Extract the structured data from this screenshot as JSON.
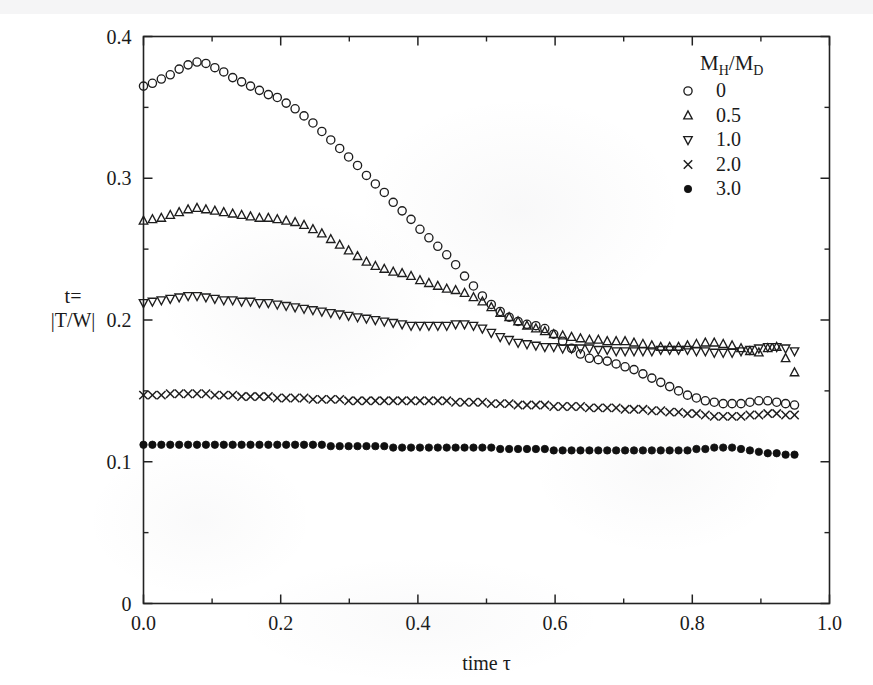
{
  "figure": {
    "background_color": "#ffffff",
    "ink_color": "#1a1a1a"
  },
  "chart_data": {
    "type": "scatter",
    "title": "",
    "xlabel": "time τ",
    "ylabel_line1": "t=",
    "ylabel_line2": "|T/W|",
    "xlim": [
      0.0,
      1.0
    ],
    "ylim": [
      0.0,
      0.4
    ],
    "grid": false,
    "xticks": [
      0.0,
      0.2,
      0.4,
      0.6,
      0.8,
      1.0
    ],
    "xticklabels": [
      "0.0",
      "0.2",
      "0.4",
      "0.6",
      "0.8",
      "1.0"
    ],
    "xticks_minor": [
      0.1,
      0.3,
      0.5,
      0.7,
      0.9
    ],
    "yticks": [
      0.0,
      0.1,
      0.2,
      0.3,
      0.4
    ],
    "yticklabels": [
      "0",
      "0.1",
      "0.2",
      "0.3",
      "0.4"
    ],
    "yticks_minor": [
      0.05,
      0.15,
      0.25,
      0.35
    ],
    "legend": {
      "title": "M_H/M_D",
      "title_parts": {
        "m": "M",
        "sub_h": "H",
        "slash": "/",
        "m2": "M",
        "sub_d": "D"
      },
      "position": "upper right",
      "entries": [
        {
          "label": "0",
          "marker": "circle-open"
        },
        {
          "label": "0.5",
          "marker": "triangle-up-open"
        },
        {
          "label": "1.0",
          "marker": "triangle-down-open"
        },
        {
          "label": "2.0",
          "marker": "cross"
        },
        {
          "label": "3.0",
          "marker": "circle-filled"
        }
      ]
    },
    "series": [
      {
        "name": "0",
        "marker": "circle-open",
        "x": [
          0.0,
          0.013,
          0.026,
          0.039,
          0.052,
          0.065,
          0.078,
          0.091,
          0.104,
          0.117,
          0.13,
          0.143,
          0.156,
          0.169,
          0.182,
          0.195,
          0.208,
          0.221,
          0.234,
          0.247,
          0.26,
          0.273,
          0.286,
          0.299,
          0.312,
          0.325,
          0.338,
          0.351,
          0.364,
          0.377,
          0.39,
          0.403,
          0.416,
          0.429,
          0.442,
          0.455,
          0.468,
          0.481,
          0.494,
          0.507,
          0.52,
          0.533,
          0.546,
          0.559,
          0.572,
          0.585,
          0.598,
          0.611,
          0.624,
          0.637,
          0.65,
          0.663,
          0.676,
          0.689,
          0.702,
          0.715,
          0.728,
          0.741,
          0.754,
          0.767,
          0.78,
          0.793,
          0.806,
          0.819,
          0.832,
          0.845,
          0.858,
          0.871,
          0.884,
          0.897,
          0.91,
          0.923,
          0.936,
          0.949
        ],
        "y": [
          0.365,
          0.367,
          0.37,
          0.373,
          0.377,
          0.38,
          0.382,
          0.381,
          0.378,
          0.375,
          0.371,
          0.368,
          0.365,
          0.362,
          0.359,
          0.357,
          0.353,
          0.349,
          0.344,
          0.339,
          0.333,
          0.327,
          0.321,
          0.315,
          0.309,
          0.302,
          0.296,
          0.29,
          0.283,
          0.277,
          0.271,
          0.264,
          0.258,
          0.252,
          0.246,
          0.239,
          0.231,
          0.224,
          0.217,
          0.211,
          0.206,
          0.202,
          0.199,
          0.197,
          0.196,
          0.194,
          0.19,
          0.185,
          0.18,
          0.176,
          0.173,
          0.172,
          0.171,
          0.169,
          0.167,
          0.165,
          0.162,
          0.159,
          0.156,
          0.153,
          0.15,
          0.147,
          0.145,
          0.143,
          0.142,
          0.141,
          0.141,
          0.141,
          0.142,
          0.143,
          0.143,
          0.142,
          0.141,
          0.14
        ],
        "note": "rises to a maximum near tau=0.06 then decays monotonically, flattening near 0.14"
      },
      {
        "name": "0.5",
        "marker": "triangle-up-open",
        "x": [
          0.0,
          0.013,
          0.026,
          0.039,
          0.052,
          0.065,
          0.078,
          0.091,
          0.104,
          0.117,
          0.13,
          0.143,
          0.156,
          0.169,
          0.182,
          0.195,
          0.208,
          0.221,
          0.234,
          0.247,
          0.26,
          0.273,
          0.286,
          0.299,
          0.312,
          0.325,
          0.338,
          0.351,
          0.364,
          0.377,
          0.39,
          0.403,
          0.416,
          0.429,
          0.442,
          0.455,
          0.468,
          0.481,
          0.494,
          0.507,
          0.52,
          0.533,
          0.546,
          0.559,
          0.572,
          0.585,
          0.598,
          0.611,
          0.624,
          0.637,
          0.65,
          0.663,
          0.676,
          0.689,
          0.702,
          0.715,
          0.728,
          0.741,
          0.754,
          0.767,
          0.78,
          0.793,
          0.806,
          0.819,
          0.832,
          0.845,
          0.858,
          0.871,
          0.884,
          0.897,
          0.91,
          0.923,
          0.936,
          0.949
        ],
        "y": [
          0.27,
          0.271,
          0.272,
          0.274,
          0.276,
          0.278,
          0.279,
          0.278,
          0.277,
          0.276,
          0.275,
          0.274,
          0.273,
          0.272,
          0.272,
          0.271,
          0.27,
          0.269,
          0.267,
          0.264,
          0.261,
          0.257,
          0.253,
          0.249,
          0.245,
          0.241,
          0.238,
          0.236,
          0.234,
          0.233,
          0.231,
          0.228,
          0.226,
          0.224,
          0.222,
          0.221,
          0.219,
          0.216,
          0.213,
          0.209,
          0.205,
          0.202,
          0.199,
          0.196,
          0.194,
          0.192,
          0.19,
          0.189,
          0.188,
          0.187,
          0.186,
          0.186,
          0.185,
          0.185,
          0.185,
          0.184,
          0.183,
          0.182,
          0.181,
          0.181,
          0.181,
          0.182,
          0.183,
          0.184,
          0.184,
          0.183,
          0.182,
          0.18,
          0.178,
          0.177,
          0.18,
          0.181,
          0.173,
          0.163
        ],
        "note": "broad low maximum near tau=0.08, slow decline to about 0.18"
      },
      {
        "name": "1.0",
        "marker": "triangle-down-open",
        "x": [
          0.0,
          0.013,
          0.026,
          0.039,
          0.052,
          0.065,
          0.078,
          0.091,
          0.104,
          0.117,
          0.13,
          0.143,
          0.156,
          0.169,
          0.182,
          0.195,
          0.208,
          0.221,
          0.234,
          0.247,
          0.26,
          0.273,
          0.286,
          0.299,
          0.312,
          0.325,
          0.338,
          0.351,
          0.364,
          0.377,
          0.39,
          0.403,
          0.416,
          0.429,
          0.442,
          0.455,
          0.468,
          0.481,
          0.494,
          0.507,
          0.52,
          0.533,
          0.546,
          0.559,
          0.572,
          0.585,
          0.598,
          0.611,
          0.624,
          0.637,
          0.65,
          0.663,
          0.676,
          0.689,
          0.702,
          0.715,
          0.728,
          0.741,
          0.754,
          0.767,
          0.78,
          0.793,
          0.806,
          0.819,
          0.832,
          0.845,
          0.858,
          0.871,
          0.884,
          0.897,
          0.91,
          0.923,
          0.936,
          0.949
        ],
        "y": [
          0.212,
          0.213,
          0.214,
          0.215,
          0.216,
          0.217,
          0.217,
          0.216,
          0.215,
          0.214,
          0.214,
          0.213,
          0.213,
          0.212,
          0.212,
          0.211,
          0.21,
          0.209,
          0.208,
          0.207,
          0.206,
          0.205,
          0.204,
          0.203,
          0.202,
          0.201,
          0.2,
          0.199,
          0.198,
          0.197,
          0.196,
          0.196,
          0.196,
          0.196,
          0.196,
          0.197,
          0.197,
          0.196,
          0.194,
          0.191,
          0.188,
          0.186,
          0.184,
          0.183,
          0.182,
          0.181,
          0.181,
          0.18,
          0.18,
          0.18,
          0.18,
          0.179,
          0.179,
          0.178,
          0.178,
          0.178,
          0.178,
          0.178,
          0.179,
          0.179,
          0.179,
          0.179,
          0.178,
          0.178,
          0.177,
          0.177,
          0.177,
          0.178,
          0.179,
          0.18,
          0.181,
          0.181,
          0.18,
          0.178
        ],
        "note": "very flat, small maximum near tau=0.06, settles near 0.18"
      },
      {
        "name": "2.0",
        "marker": "cross",
        "x": [
          0.0,
          0.013,
          0.026,
          0.039,
          0.052,
          0.065,
          0.078,
          0.091,
          0.104,
          0.117,
          0.13,
          0.143,
          0.156,
          0.169,
          0.182,
          0.195,
          0.208,
          0.221,
          0.234,
          0.247,
          0.26,
          0.273,
          0.286,
          0.299,
          0.312,
          0.325,
          0.338,
          0.351,
          0.364,
          0.377,
          0.39,
          0.403,
          0.416,
          0.429,
          0.442,
          0.455,
          0.468,
          0.481,
          0.494,
          0.507,
          0.52,
          0.533,
          0.546,
          0.559,
          0.572,
          0.585,
          0.598,
          0.611,
          0.624,
          0.637,
          0.65,
          0.663,
          0.676,
          0.689,
          0.702,
          0.715,
          0.728,
          0.741,
          0.754,
          0.767,
          0.78,
          0.793,
          0.806,
          0.819,
          0.832,
          0.845,
          0.858,
          0.871,
          0.884,
          0.897,
          0.91,
          0.923,
          0.936,
          0.949
        ],
        "y": [
          0.147,
          0.147,
          0.147,
          0.148,
          0.148,
          0.148,
          0.148,
          0.148,
          0.147,
          0.147,
          0.147,
          0.146,
          0.146,
          0.146,
          0.146,
          0.145,
          0.145,
          0.145,
          0.145,
          0.144,
          0.144,
          0.144,
          0.144,
          0.143,
          0.143,
          0.143,
          0.143,
          0.143,
          0.143,
          0.143,
          0.143,
          0.143,
          0.143,
          0.143,
          0.143,
          0.142,
          0.142,
          0.142,
          0.142,
          0.141,
          0.141,
          0.141,
          0.14,
          0.14,
          0.14,
          0.14,
          0.139,
          0.139,
          0.139,
          0.139,
          0.138,
          0.138,
          0.138,
          0.138,
          0.137,
          0.137,
          0.137,
          0.136,
          0.136,
          0.135,
          0.135,
          0.134,
          0.134,
          0.133,
          0.132,
          0.132,
          0.132,
          0.132,
          0.133,
          0.133,
          0.134,
          0.134,
          0.133,
          0.133
        ],
        "note": "nearly constant, gently declining from 0.147 to about 0.133"
      },
      {
        "name": "3.0",
        "marker": "circle-filled",
        "x": [
          0.0,
          0.013,
          0.026,
          0.039,
          0.052,
          0.065,
          0.078,
          0.091,
          0.104,
          0.117,
          0.13,
          0.143,
          0.156,
          0.169,
          0.182,
          0.195,
          0.208,
          0.221,
          0.234,
          0.247,
          0.26,
          0.273,
          0.286,
          0.299,
          0.312,
          0.325,
          0.338,
          0.351,
          0.364,
          0.377,
          0.39,
          0.403,
          0.416,
          0.429,
          0.442,
          0.455,
          0.468,
          0.481,
          0.494,
          0.507,
          0.52,
          0.533,
          0.546,
          0.559,
          0.572,
          0.585,
          0.598,
          0.611,
          0.624,
          0.637,
          0.65,
          0.663,
          0.676,
          0.689,
          0.702,
          0.715,
          0.728,
          0.741,
          0.754,
          0.767,
          0.78,
          0.793,
          0.806,
          0.819,
          0.832,
          0.845,
          0.858,
          0.871,
          0.884,
          0.897,
          0.91,
          0.923,
          0.936,
          0.949
        ],
        "y": [
          0.112,
          0.112,
          0.112,
          0.112,
          0.112,
          0.112,
          0.112,
          0.112,
          0.112,
          0.112,
          0.112,
          0.112,
          0.112,
          0.112,
          0.112,
          0.112,
          0.112,
          0.112,
          0.112,
          0.112,
          0.112,
          0.111,
          0.111,
          0.111,
          0.111,
          0.111,
          0.111,
          0.111,
          0.11,
          0.11,
          0.11,
          0.11,
          0.11,
          0.11,
          0.11,
          0.11,
          0.11,
          0.11,
          0.11,
          0.11,
          0.109,
          0.109,
          0.109,
          0.109,
          0.109,
          0.109,
          0.108,
          0.108,
          0.108,
          0.108,
          0.108,
          0.108,
          0.108,
          0.108,
          0.108,
          0.108,
          0.108,
          0.108,
          0.108,
          0.108,
          0.108,
          0.108,
          0.109,
          0.109,
          0.11,
          0.11,
          0.11,
          0.109,
          0.108,
          0.107,
          0.106,
          0.106,
          0.105,
          0.105
        ],
        "note": "essentially flat at 0.11, densely packed filled circles"
      }
    ]
  }
}
